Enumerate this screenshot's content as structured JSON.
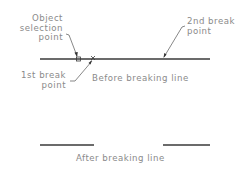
{
  "diagram": {
    "labels": {
      "object_selection_point": [
        "Object",
        "selection",
        "point"
      ],
      "first_break_point": [
        "1st break",
        "point"
      ],
      "second_break_point": [
        "2nd break",
        "point"
      ],
      "before_caption": "Before breaking line",
      "after_caption": "After breaking line"
    },
    "colors": {
      "line": "#3a3a3a",
      "text": "#8a8a8a",
      "leader": "#555555"
    }
  }
}
